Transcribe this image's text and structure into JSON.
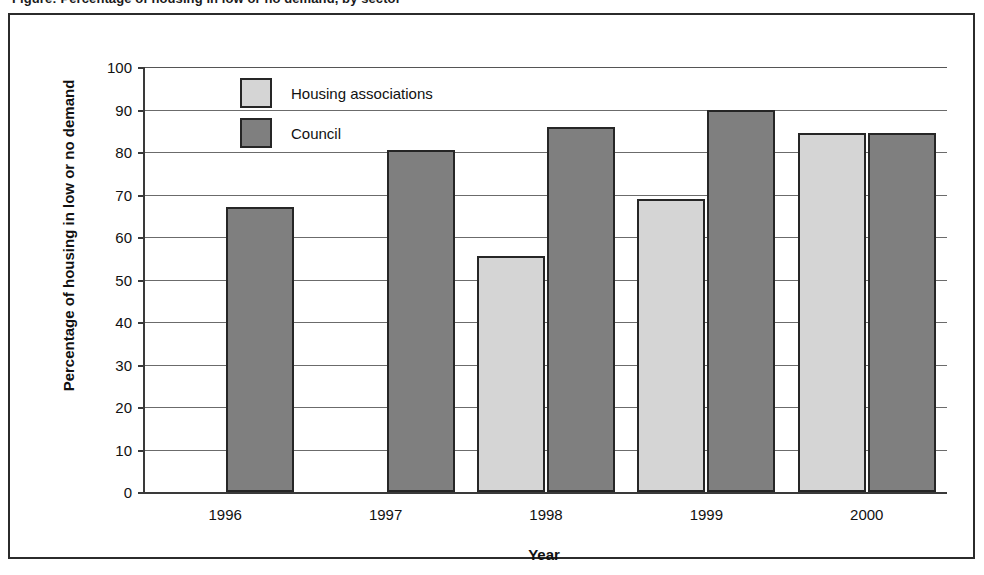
{
  "figure": {
    "clipped_title": "Figure: Percentage of housing in low or no demand, by sector",
    "border_color": "#2b2b2b"
  },
  "colors": {
    "housing_associations": "#d5d5d5",
    "council": "#7f7f7f",
    "bar_outline": "#262626",
    "gridline": "#6b6b6b",
    "axis": "#3a3a3a",
    "text": "#111111"
  },
  "chart_data": {
    "type": "bar",
    "title": "",
    "xlabel": "Year",
    "ylabel": "Percentage of housing in low or no demand",
    "categories": [
      "1996",
      "1997",
      "1998",
      "1999",
      "2000"
    ],
    "ylim": [
      0,
      100
    ],
    "ytick_labels": [
      "0",
      "10",
      "20",
      "30",
      "40",
      "50",
      "60",
      "70",
      "80",
      "90",
      "100"
    ],
    "ytick_values": [
      0,
      10,
      20,
      30,
      40,
      50,
      60,
      70,
      80,
      90,
      100
    ],
    "grid": true,
    "legend_position": "inside top-left",
    "series": [
      {
        "name": "Housing associations",
        "color": "#d5d5d5",
        "values": [
          null,
          null,
          55.5,
          69.0,
          84.5
        ]
      },
      {
        "name": "Council",
        "color": "#7f7f7f",
        "values": [
          67.0,
          80.5,
          86.0,
          90.0,
          84.5
        ]
      }
    ]
  }
}
